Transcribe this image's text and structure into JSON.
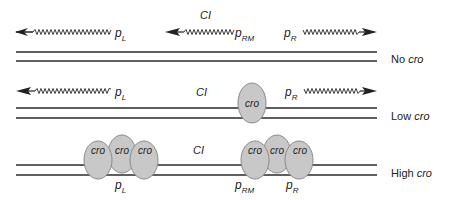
{
  "colors": {
    "line": "#2a2a2a",
    "oval_fill": "#c8c8c8",
    "oval_stroke": "#8a8a8a",
    "text": "#222222"
  },
  "gene_label": "CI",
  "protein_label": "cro",
  "promoters": {
    "left": {
      "p": "p",
      "sub": "L"
    },
    "rm": {
      "p": "p",
      "sub": "RM"
    },
    "right": {
      "p": "p",
      "sub": "R"
    }
  },
  "rows": [
    {
      "id": "no",
      "label_prefix": "No",
      "label_italic": "cro"
    },
    {
      "id": "low",
      "label_prefix": "Low",
      "label_italic": "cro"
    },
    {
      "id": "high",
      "label_prefix": "High",
      "label_italic": "cro"
    }
  ]
}
